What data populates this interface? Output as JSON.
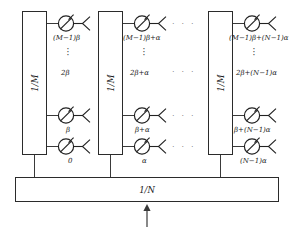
{
  "figure": {
    "type": "block-diagram",
    "background_color": "#ffffff",
    "line_color": "#2b2b2b"
  },
  "combiner": {
    "label": "1/N",
    "name": "one-over-n-divider"
  },
  "input": {
    "arrow_glyph": "↑",
    "name": "rf-input-port"
  },
  "columns": [
    {
      "id": "col-1",
      "splitter_label": "1/M",
      "elements": [
        {
          "row": "top",
          "phase": "(M−1)β"
        },
        {
          "row": "middle",
          "phase": "2β"
        },
        {
          "row": "lower",
          "phase": "β"
        },
        {
          "row": "bottom",
          "phase": "0"
        }
      ],
      "vertical_ellipsis": "⋮"
    },
    {
      "id": "col-2",
      "splitter_label": "1/M",
      "elements": [
        {
          "row": "top",
          "phase": "(M−1)β+α"
        },
        {
          "row": "middle",
          "phase": "2β+α"
        },
        {
          "row": "lower",
          "phase": "β+α"
        },
        {
          "row": "bottom",
          "phase": "α"
        }
      ],
      "vertical_ellipsis": "⋮"
    },
    {
      "id": "col-3",
      "splitter_label": "1/M",
      "elements": [
        {
          "row": "top",
          "phase": "(M−1)β+(N−1)α"
        },
        {
          "row": "middle",
          "phase": "2β+(N−1)α"
        },
        {
          "row": "lower",
          "phase": "β+(N−1)α"
        },
        {
          "row": "bottom",
          "phase": "(N−1)α"
        }
      ],
      "vertical_ellipsis": "⋮"
    }
  ],
  "horizontal_ellipses": [
    {
      "row": "top",
      "text": "· · ·"
    },
    {
      "row": "middle",
      "text": "· · ·"
    },
    {
      "row": "lower",
      "text": "· · ·"
    },
    {
      "row": "bottom",
      "text": "· · ·"
    }
  ],
  "icons": {
    "phase_shifter": "phase-shifter-icon",
    "antenna": "antenna-icon"
  }
}
